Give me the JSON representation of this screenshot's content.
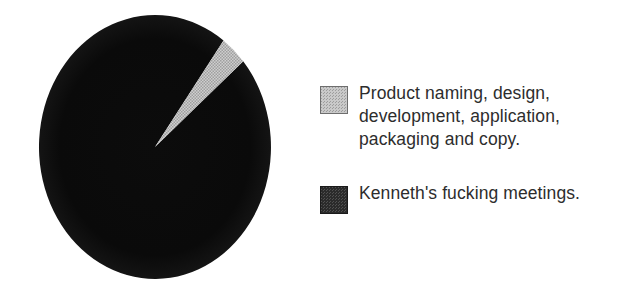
{
  "figure": {
    "background_color": "#ffffff"
  },
  "chart_data": {
    "type": "pie",
    "title": "",
    "subtitle": "",
    "xlabel": "",
    "ylabel": "",
    "grid": false,
    "legend_position": "right",
    "start_angle_deg": 49.5,
    "direction": "clockwise",
    "categories": [
      "Product naming, design, development, application, packaging and copy.",
      "Kenneth's fucking meetings."
    ],
    "values": [
      3.6,
      96.4
    ],
    "value_unit": "percent",
    "colors": [
      "#c9c9c9",
      "#111111"
    ],
    "slices": [
      {
        "label": "Product naming, design, development, application, packaging and copy.",
        "value": 3.6,
        "color": "#c9c9c9",
        "pattern": "checker-dither-light",
        "start_angle_deg": 40.5,
        "end_angle_deg": 53.8
      },
      {
        "label": "Kenneth's fucking meetings.",
        "value": 96.4,
        "color": "#111111",
        "pattern": "solid-dark",
        "start_angle_deg": 53.8,
        "end_angle_deg": 400.5
      }
    ]
  },
  "legend": {
    "entries": [
      {
        "swatch_name": "legend-swatch-product-work",
        "swatch_color": "#c9c9c9",
        "label": "Product naming, design,\ndevelopment, application,\npackaging and copy."
      },
      {
        "swatch_name": "legend-swatch-meetings",
        "swatch_color": "#2b2b2b",
        "label": "Kenneth's fucking meetings."
      }
    ]
  }
}
